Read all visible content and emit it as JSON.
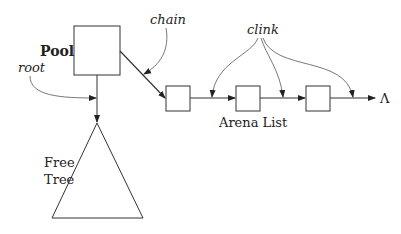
{
  "labels": {
    "pool": "Pool",
    "root": "root",
    "chain": "chain",
    "clink": "clink",
    "arena_list": "Arena List",
    "free_tree_line1": "Free",
    "free_tree_line2": "Tree",
    "terminator": "Λ"
  },
  "colors": {
    "stroke": "#333333",
    "text": "#222222"
  },
  "nodes": {
    "pool_box": {
      "x": 74,
      "y": 26,
      "w": 46,
      "h": 49
    },
    "arena_boxes": [
      {
        "x": 166,
        "y": 86,
        "w": 24,
        "h": 25
      },
      {
        "x": 236,
        "y": 86,
        "w": 24,
        "h": 25
      },
      {
        "x": 306,
        "y": 86,
        "w": 24,
        "h": 25
      }
    ],
    "free_tree_triangle": {
      "apex": [
        97,
        123
      ],
      "base_left": [
        52,
        218
      ],
      "base_right": [
        143,
        218
      ]
    }
  }
}
